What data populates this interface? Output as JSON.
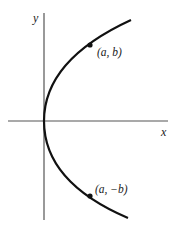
{
  "diagram": {
    "type": "parabola-opening-right",
    "axes": {
      "x_label": "x",
      "y_label": "y"
    },
    "points": [
      {
        "label": "(a, b)",
        "position": "upper-branch"
      },
      {
        "label": "(a, −b)",
        "position": "lower-branch"
      }
    ],
    "colors": {
      "curve": "#111111",
      "axes": "#555555",
      "background": "#ffffff"
    }
  }
}
